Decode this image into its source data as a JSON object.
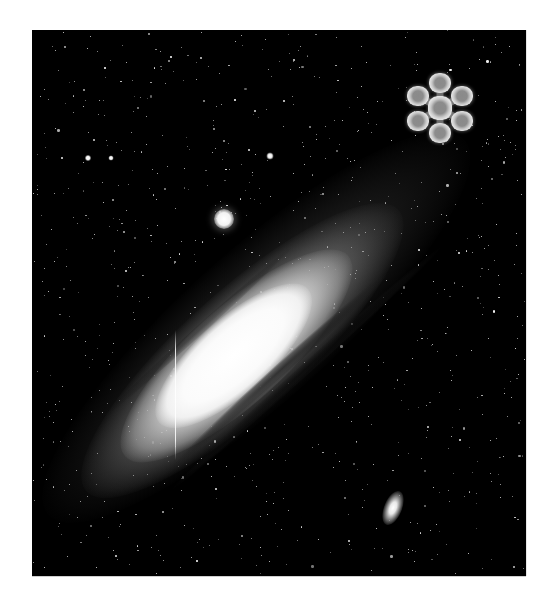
{
  "image": {
    "subject": "Andromeda Galaxy (M31) astronomical photograph",
    "tone": "grayscale",
    "background_color": "#000000",
    "page_background": "#ffffff",
    "frame": {
      "x": 32,
      "y": 30,
      "width": 494,
      "height": 546
    }
  },
  "galaxy": {
    "name": "M31",
    "center": [
      232,
      360
    ],
    "angle_deg": -42
  },
  "companions": [
    {
      "name": "M32",
      "type": "round",
      "x": 224,
      "y": 219,
      "size": 20
    },
    {
      "name": "NGC 205",
      "type": "elliptical",
      "x": 393,
      "y": 508,
      "w": 18,
      "h": 36
    }
  ],
  "bright_stars": [
    {
      "x": 88,
      "y": 158,
      "size": 6
    },
    {
      "x": 111,
      "y": 158,
      "size": 5
    },
    {
      "x": 270,
      "y": 156,
      "size": 7
    }
  ],
  "artifact": {
    "type": "vertical-line",
    "x": 175,
    "y1": 330,
    "y2": 460
  },
  "widget": {
    "name": "rosette",
    "center": [
      440,
      108
    ],
    "radius": 25,
    "nodes": 6,
    "color": "#8a8a8a"
  },
  "starfield": {
    "count": 900,
    "seed": 31
  }
}
